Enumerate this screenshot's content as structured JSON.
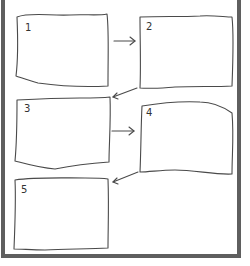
{
  "diagram": {
    "type": "sequential-storyboard",
    "stroke_color": "#4a4a4a",
    "frame_color": "#5f5f5f",
    "background_color": "#ffffff",
    "boxes": [
      {
        "label": "1"
      },
      {
        "label": "2"
      },
      {
        "label": "3"
      },
      {
        "label": "4"
      },
      {
        "label": "5"
      }
    ],
    "arrows": [
      {
        "from": "1",
        "to": "2"
      },
      {
        "from": "2",
        "to": "3"
      },
      {
        "from": "3",
        "to": "4"
      },
      {
        "from": "4",
        "to": "5"
      }
    ]
  }
}
